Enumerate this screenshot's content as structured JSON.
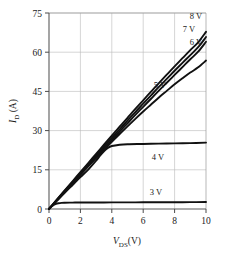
{
  "chart_data": {
    "type": "line",
    "title": "",
    "xlabel": "V_DS(V)",
    "xlabel_main": "V",
    "xlabel_sub": "DS",
    "xlabel_unit": "(V)",
    "ylabel": "I_D (A)",
    "ylabel_main": "I",
    "ylabel_sub": "D",
    "ylabel_unit": " (A)",
    "xlim": [
      0,
      10
    ],
    "ylim": [
      0,
      75
    ],
    "xticks": [
      0,
      2,
      4,
      6,
      8,
      10
    ],
    "yticks": [
      0,
      15,
      30,
      45,
      60,
      75
    ],
    "xtick_labels": [
      "0",
      "2",
      "4",
      "6",
      "8",
      "10"
    ],
    "ytick_labels": [
      "0",
      "15",
      "30",
      "45",
      "60",
      "75"
    ],
    "grid": true,
    "legend_position": "inline-annotations",
    "series": [
      {
        "name": "8 V",
        "label": "8 V",
        "x": [
          0,
          0.5,
          1,
          1.5,
          2,
          2.5,
          3,
          3.5,
          4,
          4.5,
          5,
          5.5,
          6,
          6.5,
          7,
          7.5,
          8,
          8.5,
          9,
          9.5,
          10
        ],
        "values": [
          0,
          3.6,
          7.1,
          10.6,
          14.1,
          17.6,
          21.1,
          24.6,
          28.1,
          31.5,
          34.9,
          38.3,
          41.6,
          44.9,
          48.2,
          51.4,
          54.6,
          57.7,
          60.8,
          63.8,
          67.8
        ]
      },
      {
        "name": "7 V",
        "label": "7 V",
        "x": [
          0,
          0.5,
          1,
          1.5,
          2,
          2.5,
          3,
          3.5,
          4,
          4.5,
          5,
          5.5,
          6,
          6.5,
          7,
          7.5,
          8,
          8.5,
          9,
          9.5,
          10
        ],
        "values": [
          0,
          3.5,
          6.9,
          10.3,
          13.7,
          17.1,
          20.5,
          23.9,
          27.2,
          30.5,
          33.8,
          37.1,
          40.3,
          43.5,
          46.7,
          49.8,
          52.9,
          55.9,
          58.9,
          61.9,
          65.8
        ]
      },
      {
        "name": "6 V",
        "label": "6 V",
        "x": [
          0,
          0.5,
          1,
          1.5,
          2,
          2.5,
          3,
          3.5,
          4,
          4.5,
          5,
          5.5,
          6,
          6.5,
          7,
          7.5,
          8,
          8.5,
          9,
          9.5,
          10
        ],
        "values": [
          0,
          3.4,
          6.7,
          10.0,
          13.3,
          16.6,
          19.9,
          23.2,
          26.4,
          29.6,
          32.8,
          36.0,
          39.1,
          42.2,
          45.3,
          48.3,
          51.3,
          54.3,
          57.3,
          60.2,
          64.0
        ]
      },
      {
        "name": "5 V",
        "label": "5 V",
        "x": [
          0,
          0.5,
          1,
          1.5,
          2,
          2.5,
          3,
          3.5,
          4,
          4.5,
          5,
          5.5,
          6,
          6.5,
          7,
          7.5,
          8,
          8.5,
          9,
          9.5,
          10
        ],
        "values": [
          0,
          3.3,
          6.6,
          9.9,
          13.1,
          16.3,
          19.5,
          22.6,
          25.7,
          28.7,
          31.6,
          34.5,
          37.3,
          40.0,
          42.7,
          45.2,
          47.7,
          50.0,
          52.2,
          54.2,
          56.8
        ]
      },
      {
        "name": "4 V",
        "label": "4 V",
        "x": [
          0,
          0.5,
          1,
          1.5,
          2,
          2.5,
          3,
          3.25,
          3.5,
          3.75,
          4,
          4.5,
          5,
          6,
          7,
          8,
          9,
          10
        ],
        "values": [
          0,
          3.1,
          6.2,
          9.2,
          12.2,
          15.1,
          18.5,
          20.4,
          22.1,
          23.4,
          24.1,
          24.6,
          24.8,
          24.9,
          25.0,
          25.1,
          25.2,
          25.4
        ]
      },
      {
        "name": "3 V",
        "label": "3 V",
        "x": [
          0,
          0.15,
          0.3,
          0.45,
          0.6,
          0.8,
          1,
          1.5,
          2,
          3,
          4,
          5,
          6,
          7,
          8,
          9,
          10
        ],
        "values": [
          0,
          0.9,
          1.6,
          2.0,
          2.2,
          2.35,
          2.4,
          2.45,
          2.48,
          2.5,
          2.52,
          2.54,
          2.56,
          2.58,
          2.6,
          2.62,
          2.65
        ]
      }
    ],
    "annotations": [
      {
        "text": "8 V",
        "x_px": 196,
        "y_px": 19
      },
      {
        "text": "7 V",
        "x_px": 189,
        "y_px": 32
      },
      {
        "text": "6 V",
        "x_px": 196,
        "y_px": 45
      },
      {
        "text": "5 V",
        "x_px": 160,
        "y_px": 88
      },
      {
        "text": "4 V",
        "x_px": 158,
        "y_px": 160
      },
      {
        "text": "3 V",
        "x_px": 156,
        "y_px": 195
      }
    ],
    "colors": {
      "curve": "#111111",
      "grid": "#b9b9b9",
      "axis": "#5a5a5a",
      "text": "#1a1a1a",
      "background": "#ffffff"
    }
  }
}
